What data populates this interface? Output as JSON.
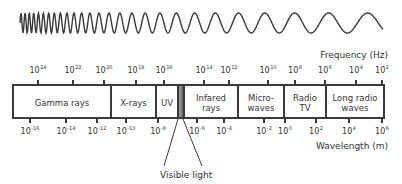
{
  "diagram": {
    "frequency_axis": {
      "title": "Frequency (Hz)",
      "ticks": [
        {
          "base": "10",
          "exp": "24",
          "x": 38
        },
        {
          "base": "10",
          "exp": "22",
          "x": 73
        },
        {
          "base": "10",
          "exp": "20",
          "x": 104
        },
        {
          "base": "10",
          "exp": "18",
          "x": 136
        },
        {
          "base": "10",
          "exp": "16",
          "x": 164
        },
        {
          "base": "10",
          "exp": "14",
          "x": 204
        },
        {
          "base": "10",
          "exp": "12",
          "x": 229
        },
        {
          "base": "10",
          "exp": "10",
          "x": 268
        },
        {
          "base": "10",
          "exp": "8",
          "x": 295
        },
        {
          "base": "10",
          "exp": "6",
          "x": 325
        },
        {
          "base": "10",
          "exp": "4",
          "x": 356
        },
        {
          "base": "10",
          "exp": "2",
          "x": 382
        }
      ]
    },
    "wavelength_axis": {
      "title": "Wavelength (m)",
      "ticks": [
        {
          "base": "10",
          "exp": "-16",
          "x": 30
        },
        {
          "base": "10",
          "exp": "-14",
          "x": 66
        },
        {
          "base": "10",
          "exp": "-12",
          "x": 97
        },
        {
          "base": "10",
          "exp": "-10",
          "x": 126
        },
        {
          "base": "10",
          "exp": "-8",
          "x": 158
        },
        {
          "base": "10",
          "exp": "-6",
          "x": 197
        },
        {
          "base": "10",
          "exp": "-4",
          "x": 224
        },
        {
          "base": "10",
          "exp": "-2",
          "x": 264
        },
        {
          "base": "10",
          "exp": "0",
          "x": 285
        },
        {
          "base": "10",
          "exp": "2",
          "x": 316
        },
        {
          "base": "10",
          "exp": "4",
          "x": 349
        },
        {
          "base": "10",
          "exp": "6",
          "x": 382
        }
      ]
    },
    "bands": [
      {
        "label": "Gamma rays",
        "left": 14,
        "width": 96
      },
      {
        "label": "X-rays",
        "left": 112,
        "width": 43
      },
      {
        "label": "UV",
        "left": 157,
        "width": 20
      },
      {
        "label": "Infared rays",
        "left": 185,
        "width": 52
      },
      {
        "label": "Micro-waves",
        "left": 239,
        "width": 44
      },
      {
        "label": "Radio TV",
        "left": 285,
        "width": 40
      },
      {
        "label": "Long radio waves",
        "left": 327,
        "width": 56
      }
    ],
    "band_lines": [
      [
        "Gamma rays"
      ],
      [
        "X-rays"
      ],
      [
        "UV"
      ],
      [
        "Infared",
        "rays"
      ],
      [
        "Micro-",
        "waves"
      ],
      [
        "Radio",
        "TV"
      ],
      [
        "Long radio",
        "waves"
      ]
    ],
    "dividers": [
      110,
      155,
      177,
      183,
      237,
      283,
      325
    ],
    "visible_light_label": "Visible light",
    "colors": {
      "line": "#3a3a3a",
      "text": "#333333",
      "background": "#ffffff"
    }
  }
}
